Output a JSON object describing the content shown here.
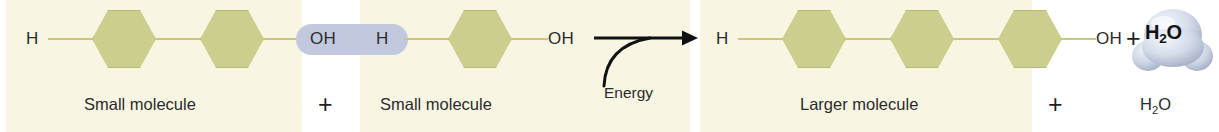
{
  "figure": {
    "background_panel_color": "#f8f6e3",
    "page_background": "#ffffff"
  },
  "colors": {
    "panel_cream": "#f8f6e3",
    "hexagon_fill": "#ccce8e",
    "hexagon_stroke": "#b9bb6a",
    "bond_line": "#c8c97a",
    "highlight_capsule": "#c2c9de",
    "water_blob_light": "#e8ecf5",
    "water_blob_mid": "#c3cbdd",
    "water_blob_shadow": "#9aa5bd",
    "text_dark": "#2b2b2b",
    "arrow_black": "#111111"
  },
  "reactants": {
    "molecule_1": {
      "caption": "Small molecule",
      "left_terminal": "H",
      "right_terminal": "OH",
      "subunit_count": 2
    },
    "molecule_2": {
      "caption": "Small molecule",
      "left_terminal": "H",
      "right_terminal": "OH",
      "subunit_count": 1
    },
    "plus_between": "+"
  },
  "highlight": {
    "label": "OH + H removed as water",
    "left_group": "OH",
    "right_group": "H"
  },
  "arrow": {
    "energy_label": "Energy",
    "direction": "right"
  },
  "products": {
    "molecule": {
      "caption": "Larger molecule",
      "left_terminal": "H",
      "right_terminal": "OH",
      "subunit_count": 3
    },
    "plus_between": "+",
    "water": {
      "blob_formula_h": "H",
      "blob_formula_sub": "2",
      "blob_formula_o": "O",
      "caption_h": "H",
      "caption_sub": "2",
      "caption_o": "O"
    }
  },
  "icons": {
    "hexagon": "hexagon-monomer-icon",
    "water_blob": "water-droplet-icon",
    "arrow": "reaction-arrow-icon"
  }
}
